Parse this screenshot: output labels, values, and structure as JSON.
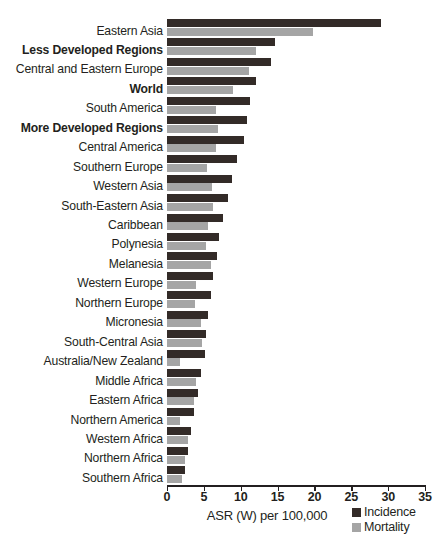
{
  "chart_data": {
    "type": "bar",
    "orientation": "horizontal",
    "title": "",
    "xlabel": "ASR (W) per 100,000",
    "ylabel": "",
    "xlim": [
      0,
      35
    ],
    "xticks": [
      0,
      5,
      10,
      15,
      20,
      25,
      30,
      35
    ],
    "grid": false,
    "legend_position": "bottom-right",
    "categories": [
      "Eastern Asia",
      "Less Developed Regions",
      "Central and Eastern Europe",
      "World",
      "South America",
      "More Developed Regions",
      "Central America",
      "Southern Europe",
      "Western Asia",
      "South-Eastern Asia",
      "Caribbean",
      "Polynesia",
      "Melanesia",
      "Western Europe",
      "Northern Europe",
      "Micronesia",
      "South-Central Asia",
      "Australia/New Zealand",
      "Middle Africa",
      "Eastern Africa",
      "Northern America",
      "Western Africa",
      "Northern Africa",
      "Southern Africa"
    ],
    "bold_categories": [
      "Less Developed Regions",
      "World",
      "More Developed Regions"
    ],
    "series": [
      {
        "name": "Incidence",
        "color": "#332b28",
        "values": [
          29.0,
          14.7,
          14.1,
          12.1,
          11.2,
          10.8,
          10.4,
          9.5,
          8.8,
          8.3,
          7.6,
          7.1,
          6.8,
          6.3,
          6.0,
          5.6,
          5.3,
          5.1,
          4.6,
          4.2,
          3.6,
          3.3,
          2.9,
          2.4
        ]
      },
      {
        "name": "Mortality",
        "color": "#a5a5a5",
        "values": [
          19.8,
          12.1,
          11.1,
          9.0,
          6.6,
          6.9,
          6.7,
          5.4,
          6.1,
          6.2,
          5.6,
          5.3,
          6.0,
          4.0,
          3.8,
          4.6,
          4.7,
          1.8,
          4.0,
          3.6,
          1.8,
          2.9,
          2.5,
          2.0
        ]
      }
    ]
  },
  "axis": {
    "x_label": "ASR (W) per 100,000",
    "tick_labels": [
      "0",
      "5",
      "10",
      "15",
      "20",
      "25",
      "30",
      "35"
    ]
  },
  "legend": {
    "items": [
      {
        "label": "Incidence",
        "swatch": "incidence-swatch"
      },
      {
        "label": "Mortality",
        "swatch": "mortality-swatch"
      }
    ]
  }
}
